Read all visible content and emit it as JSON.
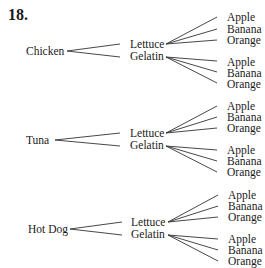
{
  "problem_number": "18.",
  "tree": {
    "blocks": [
      {
        "main": "Chicken",
        "sides": [
          "Lettuce",
          "Gelatin"
        ],
        "desserts_lettuce": [
          "Apple",
          "Banana",
          "Orange"
        ],
        "desserts_gelatin": [
          "Apple",
          "Banana",
          "Orange"
        ]
      },
      {
        "main": "Tuna",
        "sides": [
          "Lettuce",
          "Gelatin"
        ],
        "desserts_lettuce": [
          "Apple",
          "Banana",
          "Orange"
        ],
        "desserts_gelatin": [
          "Apple",
          "Banana",
          "Orange"
        ]
      },
      {
        "main": "Hot Dog",
        "sides": [
          "Lettuce",
          "Gelatin"
        ],
        "desserts_lettuce": [
          "Apple",
          "Banana",
          "Orange"
        ],
        "desserts_gelatin": [
          "Apple",
          "Banana",
          "Orange"
        ]
      }
    ]
  }
}
